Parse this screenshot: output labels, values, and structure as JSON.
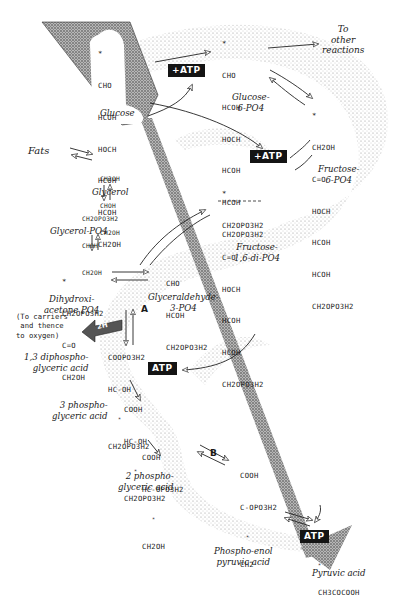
{
  "diagram": {
    "type": "metabolic pathway (glycolysis)",
    "compounds": [
      {
        "id": "glucose",
        "formula": [
          "*",
          "CHO",
          "HCOH",
          "HOCH",
          "HCOH",
          "HCOH",
          "CH2OH"
        ],
        "name": "Glucose"
      },
      {
        "id": "glucose-6-po4",
        "formula": [
          "*",
          "CHO",
          "HCOH",
          "HOCH",
          "HCOH",
          "HCOH",
          "CH2OPO3H2"
        ],
        "name": "Glucose-\n6-PO4"
      },
      {
        "id": "fructose-6-po4",
        "formula": [
          "*",
          "CH2OH",
          "C=O",
          "HOCH",
          "HCOH",
          "HCOH",
          "CH2OPO3H2"
        ],
        "name": "Fructose-\n6-PO4"
      },
      {
        "id": "fructose-1-6-di-po4",
        "formula": [
          "*",
          "CH2OPO3H2",
          "C=O",
          "HOCH",
          "HCOH",
          "HCOH",
          "CH2OPO3H2"
        ],
        "name": "Fructose-\n1,6-di-PO4"
      },
      {
        "id": "glycerol",
        "formula": [
          "CH2OH",
          "CHOH",
          "CH2OH"
        ],
        "name": "Glycerol"
      },
      {
        "id": "glycerol-po4",
        "formula": [
          "CH2OPO3H2",
          "CHOH",
          "CH2OH"
        ],
        "name": "Glycerol-PO4"
      },
      {
        "id": "dihydroxyacetone-po4",
        "formula": [
          "*",
          "CH2OPO3H2",
          "C=O",
          "CH2OH"
        ],
        "name": "Dihydroxi-\nacetone PO4"
      },
      {
        "id": "glyceraldehyde-3-po4",
        "formula": [
          "CHO",
          "HCOH",
          "CH2OPO3H2"
        ],
        "name": "Glyceraldehyde-\n3-PO4"
      },
      {
        "id": "1-3-diphosphoglyceric-acid",
        "formula": [
          "COOPO3H2",
          "HC-OH",
          "*",
          "CH2OPO3H2"
        ],
        "name": "1,3 diphospho-\nglyceric acid"
      },
      {
        "id": "3-phosphoglyceric-acid",
        "formula": [
          "COOH",
          "HC-OH",
          "*",
          "CH2OPO3H2"
        ],
        "name": "3 phospho-\nglyceric acid"
      },
      {
        "id": "2-phosphoglyceric-acid",
        "formula": [
          "COOH",
          "HC-OPO3H2",
          "*",
          "CH2OH"
        ],
        "name": "2 phospho-\nglyceric acid"
      },
      {
        "id": "phosphoenol-pyruvic-acid",
        "formula": [
          "COOH",
          "C-OPO3H2",
          "*",
          "CH2"
        ],
        "name": "Phospho-enol\npyruvic acid"
      },
      {
        "id": "pyruvic-acid",
        "formula": [
          "*",
          "CH3COCOOH"
        ],
        "name": "Pyruvic acid"
      }
    ],
    "labels": {
      "fats": "Fats",
      "to_other_reactions": "To\nother\nreactions",
      "carriers_note": "(To carriers\n and thence\nto oxygen)",
      "carrier_arrow": "2H",
      "step_a": "A",
      "step_b": "B",
      "atp_plus_1": "+ATP",
      "atp_plus_2": "+ATP",
      "atp_out_1": "ATP",
      "atp_out_2": "ATP"
    },
    "colors": {
      "ink": "#1a1a1a",
      "stipple": "#9a9a9a",
      "atp_box": "#141414",
      "background": "#ffffff"
    }
  }
}
